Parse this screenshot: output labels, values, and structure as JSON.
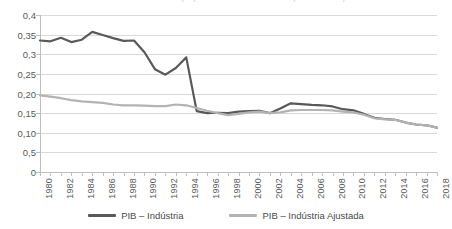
{
  "title_clipped": "Gráfico 1 – Participação da indústria no PIB (1980–2018)",
  "chart_data": {
    "type": "line",
    "title": "",
    "xlabel": "",
    "ylabel": "",
    "ylim": [
      0,
      0.4
    ],
    "xlim": [
      1980,
      2018
    ],
    "grid": true,
    "legend_position": "bottom",
    "y_tick_values": [
      0.4,
      0.35,
      0.3,
      0.25,
      0.2,
      0.15,
      0.1,
      0.05,
      0
    ],
    "y_tick_labels": [
      "0,4",
      "0,35",
      "0,3",
      "0,25",
      "0,20",
      "0,15",
      "0,10",
      "0,5",
      "0"
    ],
    "x": [
      1980,
      1981,
      1982,
      1983,
      1984,
      1985,
      1986,
      1987,
      1988,
      1989,
      1990,
      1991,
      1992,
      1993,
      1994,
      1995,
      1996,
      1997,
      1998,
      1999,
      2000,
      2001,
      2002,
      2003,
      2004,
      2005,
      2006,
      2007,
      2008,
      2009,
      2010,
      2011,
      2012,
      2013,
      2014,
      2015,
      2016,
      2017,
      2018
    ],
    "x_tick_labels": [
      "1980",
      "1982",
      "1984",
      "1986",
      "1988",
      "1990",
      "1992",
      "1994",
      "1996",
      "1998",
      "2000",
      "2002",
      "2004",
      "2006",
      "2008",
      "2010",
      "2012",
      "2014",
      "2016",
      "2018"
    ],
    "series": [
      {
        "name": "PIB – Indústria",
        "color": "#595959",
        "width": 2.2,
        "values": [
          0.335,
          0.333,
          0.342,
          0.331,
          0.337,
          0.357,
          0.349,
          0.341,
          0.334,
          0.335,
          0.305,
          0.262,
          0.248,
          0.265,
          0.292,
          0.155,
          0.15,
          0.151,
          0.15,
          0.154,
          0.155,
          0.156,
          0.15,
          0.162,
          0.175,
          0.173,
          0.171,
          0.17,
          0.167,
          0.16,
          0.157,
          0.148,
          0.138,
          0.135,
          0.133,
          0.126,
          0.121,
          0.119,
          0.113
        ]
      },
      {
        "name": "PIB – Indústria Ajustada",
        "color": "#b3b3b3",
        "width": 2.2,
        "values": [
          0.195,
          0.192,
          0.188,
          0.183,
          0.18,
          0.178,
          0.176,
          0.172,
          0.17,
          0.17,
          0.169,
          0.168,
          0.168,
          0.172,
          0.17,
          0.163,
          0.156,
          0.15,
          0.145,
          0.148,
          0.152,
          0.154,
          0.15,
          0.152,
          0.157,
          0.158,
          0.158,
          0.158,
          0.157,
          0.154,
          0.152,
          0.146,
          0.137,
          0.134,
          0.133,
          0.126,
          0.121,
          0.119,
          0.113
        ]
      }
    ]
  },
  "legend": {
    "items": [
      {
        "label": "PIB – Indústria",
        "color": "#595959"
      },
      {
        "label": "PIB – Indústria Ajustada",
        "color": "#b3b3b3"
      }
    ]
  },
  "colors": {
    "series_primary": "#595959",
    "series_secondary": "#b3b3b3",
    "gridline": "#d9d9d9",
    "axis": "#bfbfbf",
    "text": "#595959",
    "background": "#ffffff"
  }
}
